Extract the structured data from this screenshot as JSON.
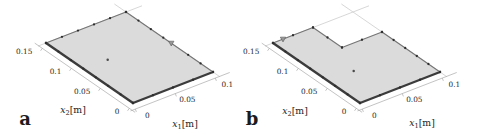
{
  "figure": {
    "description_labels": {
      "panel_a": "a",
      "panel_b": "b"
    }
  },
  "colors": {
    "background": "#ffffff",
    "plate_fill": "#dbdbdb",
    "edge_near": "#3c3c3c",
    "edge_far": "#757575",
    "marker_dot": "#2e2e2e",
    "interior_dot": "#4a4a4a",
    "triangle_fill": "#979797",
    "triangle_stroke": "#5a5a5a",
    "axis_line": "#a9a9a9",
    "back_line": "#d2d2d2"
  },
  "chart_data": [
    {
      "type": "scatter",
      "panel_label": "a",
      "shape": "rectangular plate (3D flat view)",
      "axes": {
        "x1": {
          "var": "x",
          "sub": "1",
          "unit": "[m]",
          "range": [
            0,
            0.1
          ],
          "ticks": [
            {
              "value": 0,
              "label": "0"
            },
            {
              "value": 0.05,
              "label": "0.05"
            },
            {
              "value": 0.1,
              "label": "0.1"
            }
          ]
        },
        "x2": {
          "var": "x",
          "sub": "2",
          "unit": "[m]",
          "range": [
            0,
            0.15
          ],
          "ticks": [
            {
              "value": 0,
              "label": "0"
            },
            {
              "value": 0.05,
              "label": "0.05"
            },
            {
              "value": 0.1,
              "label": "0.1"
            },
            {
              "value": 0.15,
              "label": "0.15"
            }
          ]
        }
      },
      "plate_outline_m": [
        [
          0,
          0
        ],
        [
          0.1,
          0
        ],
        [
          0.1,
          0.15
        ],
        [
          0,
          0.15
        ]
      ],
      "edges": [
        {
          "from": [
            0,
            0
          ],
          "to": [
            0.1,
            0
          ],
          "style": "near",
          "dots": 5
        },
        {
          "from": [
            0.1,
            0
          ],
          "to": [
            0.1,
            0.15
          ],
          "style": "far",
          "dots": 8,
          "skip_dots": [
            3
          ]
        },
        {
          "from": [
            0.1,
            0.15
          ],
          "to": [
            0,
            0.15
          ],
          "style": "far",
          "dots": 6
        },
        {
          "from": [
            0,
            0.15
          ],
          "to": [
            0,
            0
          ],
          "style": "near",
          "dots": 8
        }
      ],
      "triangle_marker_m": [
        0.1,
        0.072
      ],
      "interior_marker_m": [
        0.03,
        0.085
      ],
      "back_lines_m": [
        [
          [
            -0.01,
            0.15
          ],
          [
            0.12,
            0.15
          ]
        ],
        [
          [
            0.1,
            -0.012
          ],
          [
            0.1,
            0.17
          ]
        ]
      ]
    },
    {
      "type": "scatter",
      "panel_label": "b",
      "shape": "rectangular plate with corner notch (3D flat view)",
      "axes": {
        "x1": {
          "var": "x",
          "sub": "1",
          "unit": "[m]",
          "range": [
            0,
            0.1
          ],
          "ticks": [
            {
              "value": 0,
              "label": "0"
            },
            {
              "value": 0.05,
              "label": "0.05"
            },
            {
              "value": 0.1,
              "label": "0.1"
            }
          ]
        },
        "x2": {
          "var": "x",
          "sub": "2",
          "unit": "[m]",
          "range": [
            0,
            0.15
          ],
          "ticks": [
            {
              "value": 0,
              "label": "0"
            },
            {
              "value": 0.05,
              "label": "0.05"
            },
            {
              "value": 0.1,
              "label": "0.1"
            },
            {
              "value": 0.15,
              "label": "0.15"
            }
          ]
        }
      },
      "plate_outline_m": [
        [
          0,
          0
        ],
        [
          0.1,
          0
        ],
        [
          0.1,
          0.1
        ],
        [
          0.05,
          0.1
        ],
        [
          0.05,
          0.15
        ],
        [
          0,
          0.15
        ]
      ],
      "edges": [
        {
          "from": [
            0,
            0
          ],
          "to": [
            0.1,
            0
          ],
          "style": "near",
          "dots": 5
        },
        {
          "from": [
            0.1,
            0
          ],
          "to": [
            0.1,
            0.1
          ],
          "style": "far",
          "dots": 6
        },
        {
          "from": [
            0.1,
            0.1
          ],
          "to": [
            0.05,
            0.1
          ],
          "style": "far",
          "dots": 3
        },
        {
          "from": [
            0.05,
            0.1
          ],
          "to": [
            0.05,
            0.15
          ],
          "style": "far",
          "dots": 3
        },
        {
          "from": [
            0.05,
            0.15
          ],
          "to": [
            0,
            0.15
          ],
          "style": "far",
          "dots": 3
        },
        {
          "from": [
            0,
            0.15
          ],
          "to": [
            0,
            0
          ],
          "style": "near",
          "dots": 8
        }
      ],
      "triangle_marker_m": [
        0.0125,
        0.15
      ],
      "interior_marker_m": [
        0.032,
        0.055
      ],
      "back_lines_m": [
        [
          [
            -0.01,
            0.15
          ],
          [
            0.12,
            0.15
          ]
        ],
        [
          [
            0.1,
            -0.012
          ],
          [
            0.1,
            0.17
          ]
        ]
      ]
    }
  ]
}
